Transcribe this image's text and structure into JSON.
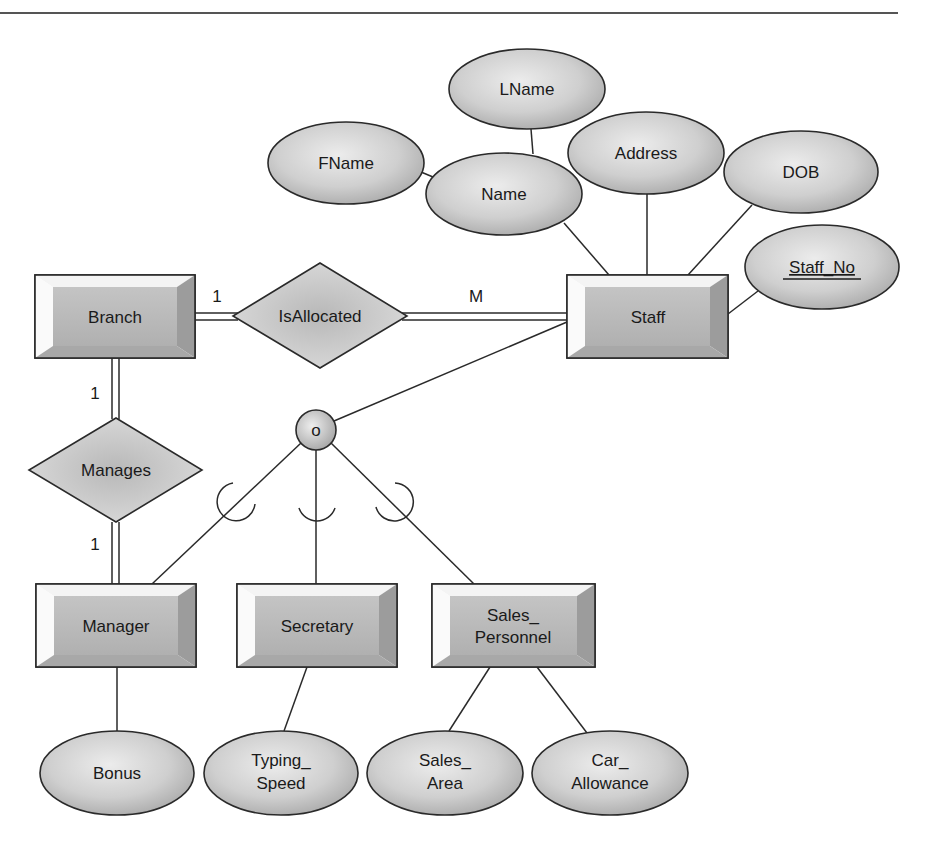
{
  "header": {
    "rule_color": "#555555"
  },
  "colors": {
    "shape_fill_light": "#e6e6e6",
    "shape_fill_dark": "#a8a8a8",
    "stroke": "#2a2a2a",
    "background": "#ffffff"
  },
  "entities": [
    {
      "id": "branch",
      "label": "Branch",
      "x": 35,
      "y": 275,
      "w": 160,
      "h": 83
    },
    {
      "id": "staff",
      "label": "Staff",
      "x": 567,
      "y": 275,
      "w": 161,
      "h": 83
    },
    {
      "id": "manager",
      "label": "Manager",
      "x": 36,
      "y": 584,
      "w": 160,
      "h": 83
    },
    {
      "id": "secretary",
      "label": "Secretary",
      "x": 237,
      "y": 584,
      "w": 160,
      "h": 83
    },
    {
      "id": "sales_personnel",
      "label_line1": "Sales_",
      "label_line2": "Personnel",
      "x": 432,
      "y": 584,
      "w": 163,
      "h": 83
    }
  ],
  "relationships": [
    {
      "id": "isallocated",
      "label": "IsAllocated",
      "cx": 320,
      "cy": 316,
      "hw": 87,
      "hh": 53
    },
    {
      "id": "manages",
      "label": "Manages",
      "cx": 116,
      "cy": 470,
      "hw": 87,
      "hh": 52
    }
  ],
  "attributes": [
    {
      "id": "lname",
      "label": "LName",
      "cx": 527,
      "cy": 89,
      "rx": 78,
      "ry": 40
    },
    {
      "id": "fname",
      "label": "FName",
      "cx": 346,
      "cy": 163,
      "rx": 78,
      "ry": 41
    },
    {
      "id": "name",
      "label": "Name",
      "cx": 504,
      "cy": 194,
      "rx": 78,
      "ry": 41
    },
    {
      "id": "address",
      "label": "Address",
      "cx": 646,
      "cy": 153,
      "rx": 78,
      "ry": 41
    },
    {
      "id": "dob",
      "label": "DOB",
      "cx": 801,
      "cy": 172,
      "rx": 77,
      "ry": 41
    },
    {
      "id": "staff_no",
      "label": "Staff_No",
      "cx": 822,
      "cy": 267,
      "rx": 77,
      "ry": 42,
      "key": true
    },
    {
      "id": "bonus",
      "label": "Bonus",
      "cx": 117,
      "cy": 773,
      "rx": 77,
      "ry": 42
    },
    {
      "id": "typing_speed",
      "label_line1": "Typing_",
      "label_line2": "Speed",
      "cx": 281,
      "cy": 773,
      "rx": 77,
      "ry": 42
    },
    {
      "id": "sales_area",
      "label_line1": "Sales_",
      "label_line2": "Area",
      "cx": 445,
      "cy": 773,
      "rx": 78,
      "ry": 42
    },
    {
      "id": "car_allowance",
      "label_line1": "Car_",
      "label_line2": "Allowance",
      "cx": 610,
      "cy": 773,
      "rx": 78,
      "ry": 42
    }
  ],
  "specialization": {
    "circle_label": "o",
    "constraint": "overlapping",
    "cx": 316,
    "cy": 430,
    "r": 20
  },
  "cardinalities": {
    "branch_isallocated": "1",
    "isallocated_staff": "M",
    "branch_manages": "1",
    "manages_manager": "1"
  }
}
